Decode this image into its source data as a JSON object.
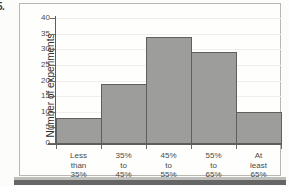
{
  "item_number": "5.",
  "chart_data": {
    "type": "bar",
    "title": "",
    "subtitle": "",
    "xlabel": "",
    "ylabel": "Number of experiments",
    "ylim": [
      0,
      40
    ],
    "ytick_step": 5,
    "ytick_labels": [
      "40",
      "35",
      "30",
      "25",
      "20",
      "15",
      "10",
      "5",
      "0"
    ],
    "grid": true,
    "legend": "none",
    "categories": [
      "Less than 35%",
      "35% to 45%",
      "45% to 55%",
      "55% to 65%",
      "At least 65%"
    ],
    "category_lines": [
      [
        "Less",
        "than",
        "35%"
      ],
      [
        "35%",
        "to",
        "45%"
      ],
      [
        "45%",
        "to",
        "55%"
      ],
      [
        "55%",
        "to",
        "65%"
      ],
      [
        "At",
        "least",
        "65%"
      ]
    ],
    "values": [
      8,
      19,
      34,
      29,
      10
    ],
    "bar_fill": "#9d9d9b",
    "bar_stroke": "#5f5f5d"
  }
}
